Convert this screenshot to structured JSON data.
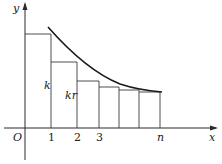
{
  "diagram": {
    "axes": {
      "x_label": "x",
      "y_label": "y",
      "origin_label": "O"
    },
    "tick_labels": [
      "1",
      "2",
      "3",
      "n"
    ],
    "rect_labels": [
      "k",
      "kr"
    ],
    "colors": {
      "line": "#2a2a2a",
      "curve": "#1a1a1a",
      "background": "#ffffff"
    }
  }
}
